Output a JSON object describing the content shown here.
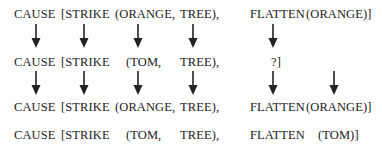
{
  "rows": [
    {
      "tokens": [
        "CAUSE",
        "[STRIKE",
        "(ORANGE,",
        "TREE),",
        "FLATTEN",
        "(ORANGE)]"
      ]
    },
    {
      "tokens": [
        "CAUSE",
        "[STRIKE",
        "(TOM,",
        "TREE),",
        "?]"
      ]
    },
    {
      "tokens": [
        "CAUSE",
        "[STRIKE",
        "(ORANGE,",
        "TREE),",
        "FLATTEN",
        "(ORANGE)]"
      ]
    },
    {
      "tokens": [
        "CAUSE",
        "[STRIKE",
        "(TOM,",
        "TREE),",
        "FLATTEN",
        "(TOM)]"
      ]
    }
  ],
  "arrow_icon": "down-arrow-icon",
  "colors": {
    "text": "#222222",
    "arrow": "#222222",
    "background": "#ffffff"
  }
}
